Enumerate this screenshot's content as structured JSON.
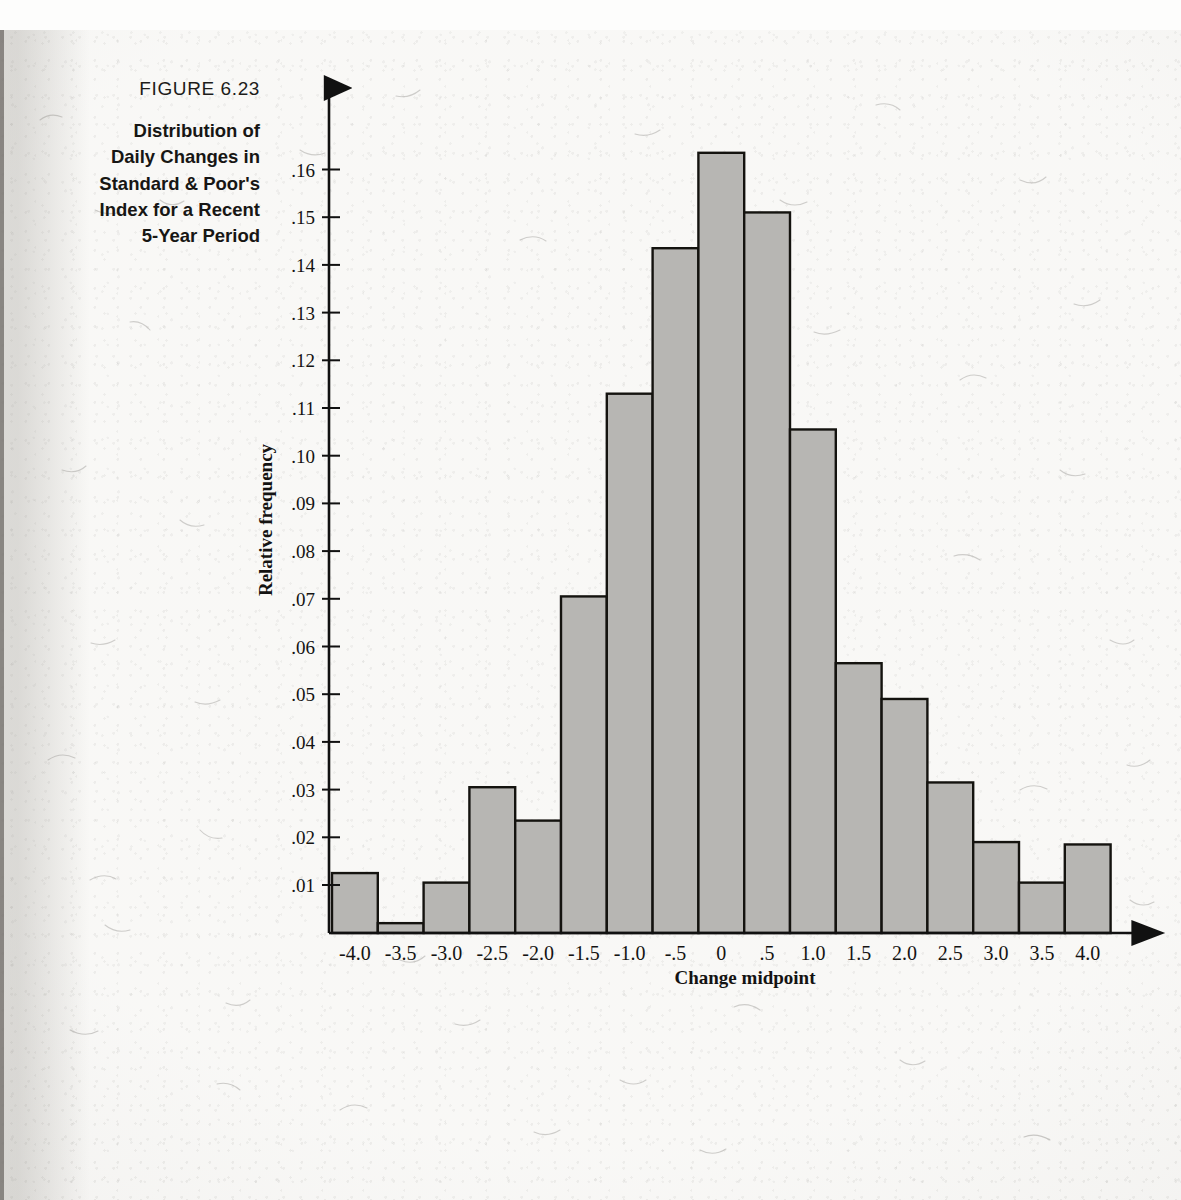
{
  "figure": {
    "number": "FIGURE 6.23",
    "title_lines": [
      "Distribution of",
      "Daily Changes in",
      "Standard & Poor's",
      "Index for a Recent",
      "5-Year Period"
    ],
    "title_full": "Distribution of Daily Changes in Standard & Poor's Index for a Recent 5-Year Period"
  },
  "colors": {
    "bar_fill": "#b7b6b3",
    "bar_stroke": "#14130f",
    "axis": "#111111",
    "paper": "#f4f3f0",
    "text": "#141312"
  },
  "chart_data": {
    "type": "bar",
    "title": "Distribution of Daily Changes in Standard & Poor's Index for a Recent 5-Year Period",
    "xlabel": "Change midpoint",
    "ylabel": "Relative frequency",
    "categories": [
      "-4.0",
      "-3.5",
      "-3.0",
      "-2.5",
      "-2.0",
      "-1.5",
      "-1.0",
      "-.5",
      "0",
      ".5",
      "1.0",
      "1.5",
      "2.0",
      "2.5",
      "3.0",
      "3.5",
      "4.0"
    ],
    "values": [
      0.0125,
      0.002,
      0.0105,
      0.0305,
      0.0235,
      0.0705,
      0.113,
      0.1435,
      0.1635,
      0.151,
      0.1055,
      0.0565,
      0.049,
      0.0315,
      0.019,
      0.0105,
      0.0185
    ],
    "xlim": [
      -4.25,
      4.25
    ],
    "ylim": [
      0,
      0.1725
    ],
    "ytick_values": [
      0.01,
      0.02,
      0.03,
      0.04,
      0.05,
      0.06,
      0.07,
      0.08,
      0.09,
      0.1,
      0.11,
      0.12,
      0.13,
      0.14,
      0.15,
      0.16
    ],
    "ytick_labels": [
      ".01",
      ".02",
      ".03",
      ".04",
      ".05",
      ".06",
      ".07",
      ".08",
      ".09",
      ".10",
      ".11",
      ".12",
      ".13",
      ".14",
      ".15",
      ".16"
    ],
    "xtick_values": [
      -4.0,
      -3.5,
      -3.0,
      -2.5,
      -2.0,
      -1.5,
      -1.0,
      -0.5,
      0,
      0.5,
      1.0,
      1.5,
      2.0,
      2.5,
      3.0,
      3.5,
      4.0
    ],
    "xtick_labels": [
      "-4.0",
      "-3.5",
      "-3.0",
      "-2.5",
      "-2.0",
      "-1.5",
      "-1.0",
      "-.5",
      "0",
      ".5",
      "1.0",
      "1.5",
      "2.0",
      "2.5",
      "3.0",
      "3.5",
      "4.0"
    ],
    "grid": false,
    "legend": false,
    "bin_width": 0.5
  }
}
